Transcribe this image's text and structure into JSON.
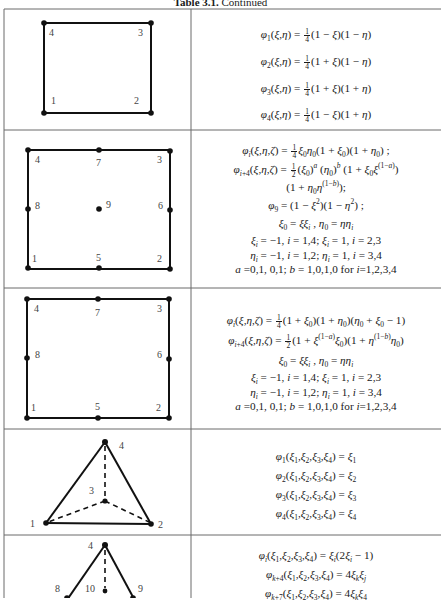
{
  "caption": {
    "label": "Table 3.1.",
    "text": "Continued"
  },
  "rows": [
    {
      "element": "4-node bilinear quadrilateral",
      "node_labels": [
        "1",
        "2",
        "3",
        "4"
      ],
      "formulas": [
        "φ1(ξ,η) = 1/4 (1−ξ)(1−η)",
        "φ2(ξ,η) = 1/4 (1+ξ)(1−η)",
        "φ3(ξ,η) = 1/4 (1+ξ)(1+η)",
        "φ4(ξ,η) = 1/4 (1−ξ)(1+η)"
      ]
    },
    {
      "element": "9-node Lagrange quadrilateral",
      "node_labels": [
        "1",
        "2",
        "3",
        "4",
        "5",
        "6",
        "7",
        "8",
        "9"
      ],
      "formulas": [
        "φi(ξ,η,ζ) = 1/4 ξ0 η0 (1+ξ0)(1+η0) ;",
        "φi+4(ξ,η,ζ) = 1/2 (ξ0)^a (η0)^b (1+ξ0 ξ^(1−a))",
        "(1+η0 η^(1−b));",
        "φ9 = (1−ξ²)(1−η²) ;",
        "ξ0 = ξξi , η0 = ηηi",
        "ξi = −1, i = 1,4; ξi = 1, i = 2,3",
        "ηi = −1, i = 1,2; ηi = 1, i = 3,4",
        "a =0,1, 0,1; b = 1,0,1,0 for i=1,2,3,4"
      ]
    },
    {
      "element": "8-node serendipity quadrilateral",
      "node_labels": [
        "1",
        "2",
        "3",
        "4",
        "5",
        "6",
        "7",
        "8"
      ],
      "formulas": [
        "φi(ξ,η,ζ) = 1/4 (1+ξ0)(1+η0)(η0+ξ0−1)",
        "φi+4(ξ,η,ζ) = 1/2 (1+ξ^(1−a) ξ0)(1+η^(1−b) η0)",
        "ξ0 = ξξi , η0 = ηηi",
        "ξi = −1, i = 1,4; ξi = 1, i = 2,3",
        "ηi = −1, i = 1,2; ηi = 1, i = 3,4",
        "a =0,1, 0,1; b = 1,0,1,0 for i=1,2,3,4"
      ]
    },
    {
      "element": "4-node linear tetrahedron",
      "node_labels": [
        "1",
        "2",
        "3",
        "4"
      ],
      "formulas": [
        "φ1(ξ1,ξ2,ξ3,ξ4) = ξ1",
        "φ2(ξ1,ξ2,ξ3,ξ4) = ξ2",
        "φ3(ξ1,ξ2,ξ3,ξ4) = ξ3",
        "φ4(ξ1,ξ2,ξ3,ξ4) = ξ4"
      ]
    },
    {
      "element": "10-node quadratic tetrahedron",
      "node_labels": [
        "4",
        "8",
        "9",
        "10"
      ],
      "formulas": [
        "φi(ξ1,ξ2,ξ3,ξ4) = ξi(2ξi −1)",
        "φk+4(ξ1,ξ2,ξ3,ξ4) = 4ξk ξj",
        "φk+7(ξ1,ξ2,ξ3,ξ4) = 4ξk ξ4"
      ]
    }
  ]
}
